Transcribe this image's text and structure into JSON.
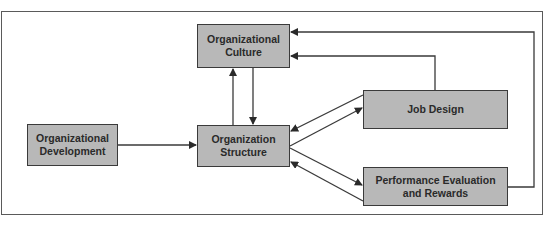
{
  "diagram": {
    "nodes": [
      {
        "id": "culture",
        "label": "Organizational\nCulture"
      },
      {
        "id": "development",
        "label": "Organizational\nDevelopment"
      },
      {
        "id": "structure",
        "label": "Organization\nStructure"
      },
      {
        "id": "job_design",
        "label": "Job Design"
      },
      {
        "id": "performance",
        "label": "Performance Evaluation\nand Rewards"
      }
    ],
    "edges": [
      {
        "from": "development",
        "to": "structure"
      },
      {
        "from": "structure",
        "to": "culture"
      },
      {
        "from": "culture",
        "to": "structure"
      },
      {
        "from": "structure",
        "to": "job_design"
      },
      {
        "from": "job_design",
        "to": "structure"
      },
      {
        "from": "structure",
        "to": "performance"
      },
      {
        "from": "performance",
        "to": "structure"
      },
      {
        "from": "job_design",
        "to": "culture"
      },
      {
        "from": "performance",
        "to": "culture"
      }
    ],
    "colors": {
      "box_fill": "#b8b8b8",
      "line": "#3a3a3a"
    }
  }
}
